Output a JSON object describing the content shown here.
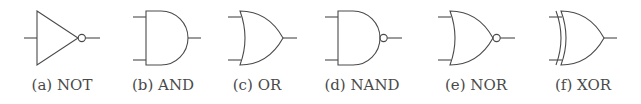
{
  "figure": {
    "stroke_color": "#4a4a4a",
    "gates": [
      {
        "id": "not",
        "label": "(a) NOT",
        "type": "NOT"
      },
      {
        "id": "and",
        "label": "(b) AND",
        "type": "AND"
      },
      {
        "id": "or",
        "label": "(c) OR",
        "type": "OR"
      },
      {
        "id": "nand",
        "label": "(d) NAND",
        "type": "NAND"
      },
      {
        "id": "nor",
        "label": "(e) NOR",
        "type": "NOR"
      },
      {
        "id": "xor",
        "label": "(f) XOR",
        "type": "XOR"
      }
    ]
  }
}
